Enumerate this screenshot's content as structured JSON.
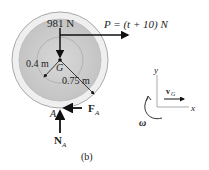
{
  "figure": {
    "caption": "(b)",
    "weight_label": "981 N",
    "force_p_label": "P = (t + 10) N",
    "center_label": "G",
    "inner_radius_label": "0.4 m",
    "outer_radius_label": "0.75 m",
    "contact_point_label": "A",
    "friction_label": "F",
    "friction_sub": "A",
    "normal_label": "N",
    "normal_sub": "A"
  },
  "axes": {
    "y_label": "y",
    "x_label": "x",
    "velocity_label": "v",
    "velocity_sub": "G",
    "omega_label": "ω"
  },
  "colors": {
    "disc_fill": "#cfcfcf",
    "rim_fill": "#ececec",
    "outline": "#9a9a9a",
    "ink": "#111111"
  }
}
